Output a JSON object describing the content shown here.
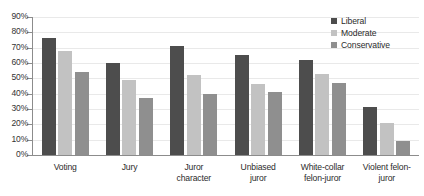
{
  "chart_data": {
    "type": "bar",
    "title": "",
    "subtitle": "",
    "xlabel": "",
    "ylabel": "",
    "ylim": [
      0,
      90
    ],
    "ytick_step": 10,
    "ytick_labels": [
      "0%",
      "10%",
      "20%",
      "30%",
      "40%",
      "50%",
      "60%",
      "70%",
      "80%",
      "90%"
    ],
    "grid": true,
    "legend_position": "top-right",
    "categories": [
      "Voting",
      "Jury",
      "Juror character",
      "Unbiased juror",
      "White-collar felon-juror",
      "Violent felon-juror"
    ],
    "category_lines": [
      [
        "Voting"
      ],
      [
        "Jury"
      ],
      [
        "Juror",
        "character"
      ],
      [
        "Unbiased",
        "juror"
      ],
      [
        "White-collar",
        "felon-juror"
      ],
      [
        "Violent felon-",
        "juror"
      ]
    ],
    "series": [
      {
        "name": "Liberal",
        "color": "#4d4d4d",
        "values": [
          76,
          60,
          71,
          65,
          62,
          31
        ]
      },
      {
        "name": "Moderate",
        "color": "#c2c2c2",
        "values": [
          68,
          49,
          52,
          46,
          53,
          21
        ]
      },
      {
        "name": "Conservative",
        "color": "#8f8f8f",
        "values": [
          54,
          37,
          40,
          41,
          47,
          9
        ]
      }
    ]
  },
  "legend": {
    "items": [
      {
        "label": "Liberal"
      },
      {
        "label": "Moderate"
      },
      {
        "label": "Conservative"
      }
    ]
  },
  "colors": {
    "liberal": "#4d4d4d",
    "moderate": "#c2c2c2",
    "conservative": "#8f8f8f",
    "axis": "#8c8c8c",
    "grid": "#e9e9e9",
    "text": "#2b2b2b",
    "background": "#ffffff"
  }
}
